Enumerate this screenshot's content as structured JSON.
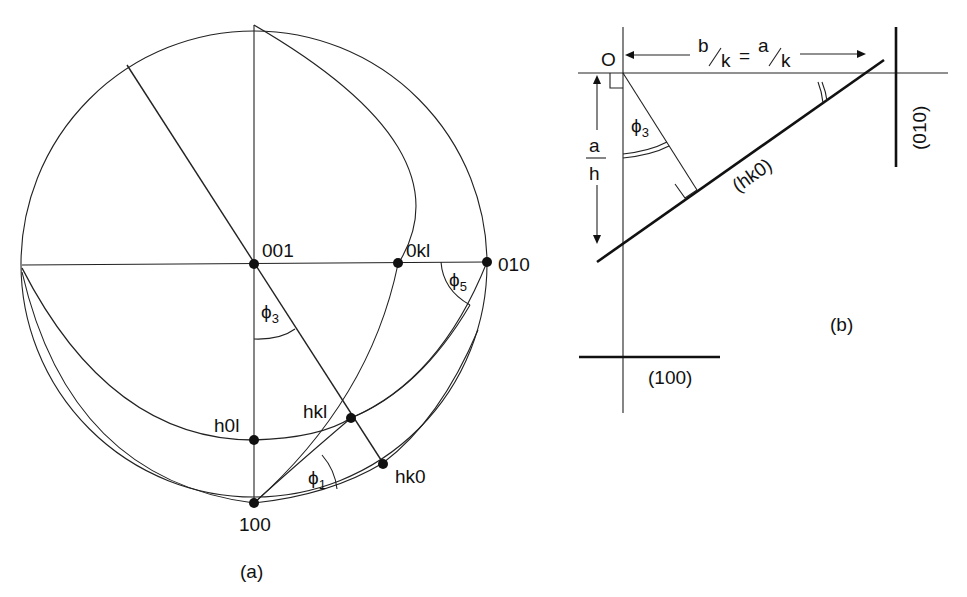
{
  "figure": {
    "panel_a": {
      "caption": "(a)",
      "poles": {
        "p001": "001",
        "p0kl": "0kl",
        "p010": "010",
        "ph0l": "h0l",
        "phkl": "hkl",
        "phk0": "hk0",
        "p100": "100"
      },
      "angles": {
        "phi3": {
          "symbol": "ϕ",
          "sub": "3"
        },
        "phi5": {
          "symbol": "ϕ",
          "sub": "5"
        },
        "phi1": {
          "symbol": "ϕ",
          "sub": "1"
        }
      }
    },
    "panel_b": {
      "caption": "(b)",
      "origin": "O",
      "intercept_top": {
        "b": "b",
        "k1": "k",
        "eq": "=",
        "a": "a",
        "k2": "k"
      },
      "intercept_left": {
        "num": "a",
        "den": "h"
      },
      "angle_phi3": {
        "symbol": "ϕ",
        "sub": "3"
      },
      "planes": {
        "hk0": "(hk0)",
        "p010": "(010)",
        "p100": "(100)"
      }
    }
  }
}
